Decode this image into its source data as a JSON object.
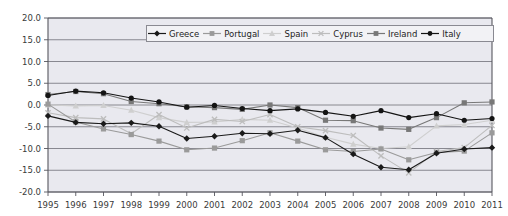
{
  "chart_data": {
    "type": "line",
    "title": "",
    "xlabel": "",
    "ylabel": "",
    "grid": true,
    "legend_position": "top-center-inside",
    "ylim": [
      -20.0,
      20.0
    ],
    "ytick_step": 5.0,
    "ytick_labels": [
      "20.0",
      "15.0",
      "10.0",
      "5.0",
      "0.0",
      "-5.0",
      "-10.0",
      "-15.0",
      "-20.0"
    ],
    "ytick_values": [
      20.0,
      15.0,
      10.0,
      5.0,
      0.0,
      -5.0,
      -10.0,
      -15.0,
      -20.0
    ],
    "categories": [
      "1995",
      "1996",
      "1997",
      "1998",
      "1999",
      "2000",
      "2001",
      "2002",
      "2003",
      "2004",
      "2005",
      "2006",
      "2007",
      "2008",
      "2009",
      "2010",
      "2011"
    ],
    "x": [
      1995,
      1996,
      1997,
      1998,
      1999,
      2000,
      2001,
      2002,
      2003,
      2004,
      2005,
      2006,
      2007,
      2008,
      2009,
      2010,
      2011
    ],
    "series": [
      {
        "name": "Greece",
        "color": "#1a1a1a",
        "marker": "diamond",
        "values": [
          -2.5,
          -4.0,
          -4.3,
          -4.1,
          -4.9,
          -7.7,
          -7.2,
          -6.5,
          -6.6,
          -5.8,
          -7.5,
          -11.3,
          -14.3,
          -14.9,
          -11.1,
          -10.1,
          -9.8
        ]
      },
      {
        "name": "Portugal",
        "color": "#9a9a9a",
        "marker": "square",
        "values": [
          0.2,
          -3.9,
          -5.5,
          -6.8,
          -8.3,
          -10.3,
          -9.9,
          -8.2,
          -6.4,
          -8.3,
          -10.3,
          -10.7,
          -10.1,
          -12.6,
          -10.9,
          -10.6,
          -6.4
        ]
      },
      {
        "name": "Spain",
        "color": "#cfcfcf",
        "marker": "triangle",
        "values": [
          0.0,
          -0.2,
          -0.1,
          -1.2,
          -2.9,
          -4.0,
          -3.9,
          -3.3,
          -3.5,
          -5.3,
          -7.4,
          -9.0,
          -10.0,
          -9.6,
          -4.8,
          -4.5,
          -3.5
        ]
      },
      {
        "name": "Cyprus",
        "color": "#bdbdbd",
        "marker": "cross",
        "values": [
          -1.8,
          -2.9,
          -3.2,
          -6.6,
          -2.2,
          -5.3,
          -3.3,
          -3.8,
          -2.2,
          -5.0,
          -5.9,
          -7.0,
          -11.7,
          -15.6,
          -10.7,
          -9.8,
          -4.7
        ]
      },
      {
        "name": "Ireland",
        "color": "#787878",
        "marker": "square",
        "values": [
          2.4,
          3.1,
          2.6,
          0.8,
          0.3,
          -0.4,
          -0.6,
          -1.0,
          0.0,
          -0.6,
          -3.5,
          -3.6,
          -5.3,
          -5.6,
          -2.9,
          0.5,
          0.7
        ]
      },
      {
        "name": "Italy",
        "color": "#141414",
        "marker": "circle",
        "values": [
          2.2,
          3.2,
          2.8,
          1.6,
          0.7,
          -0.5,
          -0.1,
          -0.8,
          -1.3,
          -0.9,
          -1.7,
          -2.6,
          -1.3,
          -2.9,
          -2.0,
          -3.5,
          -3.1
        ]
      }
    ]
  },
  "legend": {
    "items": [
      {
        "label": "Greece"
      },
      {
        "label": "Portugal"
      },
      {
        "label": "Spain"
      },
      {
        "label": "Cyprus"
      },
      {
        "label": "Ireland"
      },
      {
        "label": "Italy"
      }
    ]
  },
  "style": {
    "plot_background": "#e9e9ef",
    "grid_color": "#6f6f77",
    "axis_color": "#56565e",
    "legend_background": "#f2f2f5",
    "legend_border": "#8a8a92",
    "tick_text_color": "#3a3a3a"
  }
}
